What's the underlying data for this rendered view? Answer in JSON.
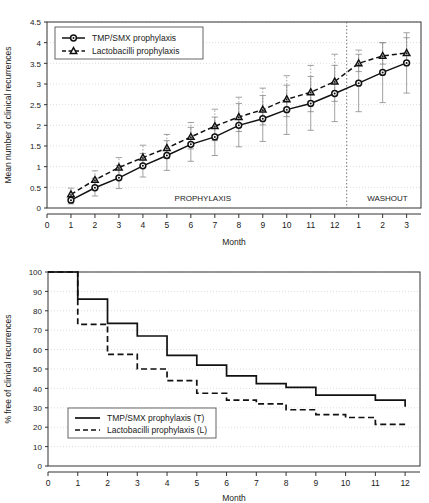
{
  "figure": {
    "panels": [
      "top",
      "bottom"
    ]
  },
  "chart_data": [
    {
      "id": "mean-recurrences",
      "type": "line",
      "title": "",
      "xlabel": "Month",
      "ylabel": "Mean number of clinical recurrences",
      "xlim": [
        0,
        15.6
      ],
      "ylim": [
        0,
        4.5
      ],
      "yticks": [
        0,
        0.5,
        1,
        1.5,
        2,
        2.5,
        3,
        3.5,
        4,
        4.5
      ],
      "ytick_labels": [
        "0",
        "0.5",
        "1",
        "1.5",
        "2",
        "2.5",
        "3",
        "3.5",
        "4",
        "4.5"
      ],
      "xticks": [
        0,
        1,
        2,
        3,
        4,
        5,
        6,
        7,
        8,
        9,
        10,
        11,
        12,
        13,
        14,
        15
      ],
      "xtick_labels": [
        "0",
        "1",
        "2",
        "3",
        "4",
        "5",
        "6",
        "7",
        "8",
        "9",
        "10",
        "11",
        "12",
        "1",
        "2",
        "3"
      ],
      "grid": true,
      "legend_position": "top-left",
      "annotations": [
        {
          "text": "PROPHYLAXIS",
          "x": 6.5,
          "y": 0.18
        },
        {
          "text": "WASHOUT",
          "x": 14.2,
          "y": 0.18
        }
      ],
      "divider_x": 12.5,
      "series": [
        {
          "name": "TMP/SMX prophylaxis",
          "marker": "circle",
          "linestyle": "solid",
          "x": [
            1,
            2,
            3,
            4,
            5,
            6,
            7,
            8,
            9,
            10,
            11,
            12,
            13,
            14,
            15
          ],
          "values": [
            0.19,
            0.49,
            0.73,
            1.02,
            1.27,
            1.54,
            1.72,
            2.0,
            2.16,
            2.38,
            2.53,
            2.77,
            3.02,
            3.28,
            3.51
          ],
          "err_low": [
            0.1,
            0.29,
            0.47,
            0.75,
            0.91,
            1.13,
            1.27,
            1.48,
            1.61,
            1.78,
            1.88,
            2.09,
            2.33,
            2.55,
            2.78
          ],
          "err_high": [
            0.3,
            0.72,
            1.03,
            1.32,
            1.63,
            1.95,
            2.2,
            2.53,
            2.72,
            2.97,
            3.18,
            3.45,
            3.72,
            4.0,
            4.24
          ]
        },
        {
          "name": "Lactobacilli prophylaxis",
          "marker": "triangle",
          "linestyle": "dashed",
          "x": [
            1,
            2,
            3,
            4,
            5,
            6,
            7,
            8,
            9,
            10,
            11,
            12,
            13,
            14,
            15
          ],
          "values": [
            0.33,
            0.68,
            0.98,
            1.22,
            1.45,
            1.72,
            1.98,
            2.2,
            2.38,
            2.63,
            2.8,
            3.06,
            3.5,
            3.68,
            3.75
          ],
          "err_low": [
            0.2,
            0.49,
            0.77,
            1.0,
            1.2,
            1.43,
            1.63,
            1.85,
            2.01,
            2.21,
            2.33,
            2.58,
            3.3,
            3.48,
            3.53
          ],
          "err_high": [
            0.48,
            0.9,
            1.22,
            1.52,
            1.78,
            2.07,
            2.39,
            2.68,
            2.9,
            3.2,
            3.45,
            3.72,
            3.82,
            4.0,
            4.12
          ]
        }
      ]
    },
    {
      "id": "percent-free-recurrences",
      "type": "line",
      "title": "",
      "xlabel": "Month",
      "ylabel": "% free of clinical recurrences",
      "xlim": [
        0,
        12.5
      ],
      "ylim": [
        0,
        100
      ],
      "yticks": [
        0,
        10,
        20,
        30,
        40,
        50,
        60,
        70,
        80,
        90,
        100
      ],
      "ytick_labels": [
        "0",
        "10",
        "20",
        "30",
        "40",
        "50",
        "60",
        "70",
        "80",
        "90",
        "100"
      ],
      "xticks": [
        0,
        1,
        2,
        3,
        4,
        5,
        6,
        7,
        8,
        9,
        10,
        11,
        12
      ],
      "xtick_labels": [
        "0",
        "1",
        "2",
        "3",
        "4",
        "5",
        "6",
        "7",
        "8",
        "9",
        "10",
        "11",
        "12"
      ],
      "grid": true,
      "legend_position": "lower-left",
      "step": true,
      "series": [
        {
          "name": "TMP/SMX prophylaxis (T)",
          "linestyle": "solid",
          "x": [
            0,
            1,
            2,
            3,
            4,
            5,
            6,
            7,
            8,
            9,
            10,
            11,
            12
          ],
          "values": [
            100,
            86,
            73.5,
            67,
            57,
            52,
            46.5,
            42.5,
            40.5,
            36.5,
            36.5,
            34,
            30.5
          ]
        },
        {
          "name": "Lactobacilli prophylaxis (L)",
          "linestyle": "dashed",
          "x": [
            0,
            1,
            2,
            3,
            4,
            5,
            6,
            7,
            8,
            9,
            10,
            11,
            12
          ],
          "values": [
            100,
            73,
            57.5,
            50,
            44,
            37.5,
            34,
            32,
            29,
            26.5,
            25,
            21.5,
            21.5
          ]
        }
      ]
    }
  ],
  "legends": {
    "top": [
      {
        "label": "TMP/SMX prophylaxis",
        "marker": "circle",
        "style": "solid"
      },
      {
        "label": "Lactobacilli prophylaxis",
        "marker": "triangle",
        "style": "dashed"
      }
    ],
    "bottom": [
      {
        "label": "TMP/SMX prophylaxis (T)",
        "marker": "none",
        "style": "solid"
      },
      {
        "label": "Lactobacilli prophylaxis (L)",
        "marker": "none",
        "style": "dashed"
      }
    ]
  },
  "colors": {
    "line": "#111111",
    "grid": "#cfcfcf",
    "axis": "#333333",
    "errorbar": "#8a8a8a",
    "background": "#ffffff"
  }
}
